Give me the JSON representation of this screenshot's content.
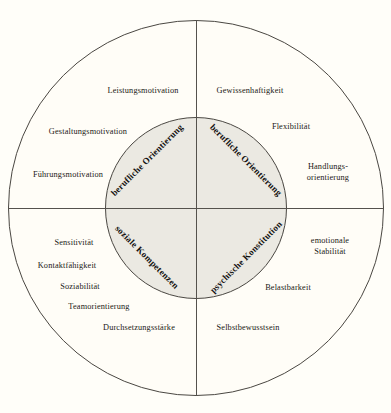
{
  "diagram": {
    "colors": {
      "background": "#fffef9",
      "outer_circle_fill": "#fffdf7",
      "inner_circle_fill": "#ebe9e2",
      "line": "#4a4742",
      "text": "#1a1815"
    },
    "inner_segments": [
      {
        "label": "berufliche Orientierung",
        "quadrant": "top-left"
      },
      {
        "label": "berufliche Orientierung",
        "quadrant": "top-right"
      },
      {
        "label": "soziale Kompetenzen",
        "quadrant": "bottom-left"
      },
      {
        "label": "psychische Konstitution",
        "quadrant": "bottom-right"
      }
    ],
    "outer_labels": {
      "top_left": [
        "Leistungsmotivation",
        "Gestaltungsmotivation",
        "Führungsmotivation"
      ],
      "top_right": [
        "Gewissenhaftigkeit",
        "Flexibilität",
        "Handlungs-\norientierung"
      ],
      "bottom_left": [
        "Sensitivität",
        "Kontaktfähigkeit",
        "Soziabilität",
        "Teamorientierung",
        "Durchsetzungsstärke"
      ],
      "bottom_right": [
        "emotionale Stabilität",
        "Belastbarkeit",
        "Selbstbewusstsein"
      ]
    }
  }
}
